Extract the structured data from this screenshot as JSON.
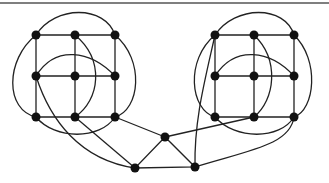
{
  "diagram": {
    "type": "graph",
    "colors": {
      "edge": "#222222",
      "node": "#111111",
      "rule": "#555555"
    },
    "nodes": [
      {
        "id": "L00",
        "x": 36,
        "y": 35
      },
      {
        "id": "L01",
        "x": 75,
        "y": 35
      },
      {
        "id": "L02",
        "x": 115,
        "y": 35
      },
      {
        "id": "L10",
        "x": 36,
        "y": 76
      },
      {
        "id": "L11",
        "x": 75,
        "y": 76
      },
      {
        "id": "L12",
        "x": 115,
        "y": 76
      },
      {
        "id": "L20",
        "x": 36,
        "y": 117
      },
      {
        "id": "L21",
        "x": 75,
        "y": 117
      },
      {
        "id": "L22",
        "x": 115,
        "y": 117
      },
      {
        "id": "R00",
        "x": 215,
        "y": 35
      },
      {
        "id": "R01",
        "x": 254,
        "y": 35
      },
      {
        "id": "R02",
        "x": 294,
        "y": 35
      },
      {
        "id": "R10",
        "x": 215,
        "y": 76
      },
      {
        "id": "R11",
        "x": 254,
        "y": 76
      },
      {
        "id": "R12",
        "x": 294,
        "y": 76
      },
      {
        "id": "R20",
        "x": 215,
        "y": 117
      },
      {
        "id": "R21",
        "x": 254,
        "y": 117
      },
      {
        "id": "R22",
        "x": 294,
        "y": 117
      },
      {
        "id": "M",
        "x": 165,
        "y": 137
      },
      {
        "id": "BL",
        "x": 135,
        "y": 168
      },
      {
        "id": "BR",
        "x": 195,
        "y": 167
      }
    ]
  }
}
